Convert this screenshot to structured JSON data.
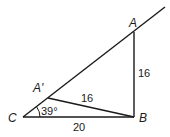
{
  "diagram": {
    "type": "geometry-triangle",
    "points": {
      "A": {
        "label": "A",
        "x": 134,
        "y": 32
      },
      "A_prime": {
        "label": "A'",
        "x": 48,
        "y": 98
      },
      "B": {
        "label": "B",
        "x": 134,
        "y": 117
      },
      "C": {
        "label": "C",
        "x": 23,
        "y": 117
      }
    },
    "ray_end": {
      "x": 165,
      "y": 7
    },
    "measurements": {
      "AB": "16",
      "A_prime_B": "16",
      "CB": "20",
      "angle_C": "39°"
    },
    "colors": {
      "stroke": "#1a1a1a",
      "background": "#ffffff"
    }
  }
}
